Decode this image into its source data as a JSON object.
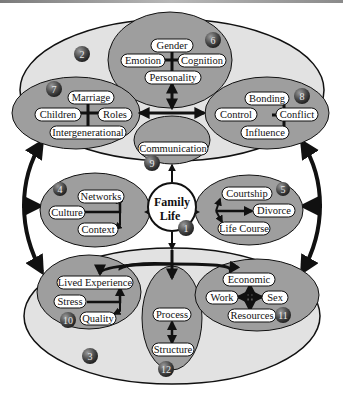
{
  "diagram": {
    "center": {
      "line1": "Family",
      "line2": "Life",
      "number": "1"
    },
    "outer_top": {
      "number": "2"
    },
    "outer_bottom": {
      "number": "3"
    },
    "themes": {
      "t4": {
        "number": "4",
        "items": [
          "Networks",
          "Culture",
          "Context"
        ]
      },
      "t5": {
        "number": "5",
        "items": [
          "Courtship",
          "Divorce",
          "Life Course"
        ]
      },
      "t6": {
        "number": "6",
        "items": [
          "Gender",
          "Emotion",
          "Cognition",
          "Personality"
        ]
      },
      "t7": {
        "number": "7",
        "items": [
          "Marriage",
          "Children",
          "Roles",
          "Intergenerational"
        ]
      },
      "t8": {
        "number": "8",
        "items": [
          "Bonding",
          "Control",
          "Conflict",
          "Influence"
        ]
      },
      "t9": {
        "number": "9",
        "items": [
          "Communication"
        ]
      },
      "t10": {
        "number": "10",
        "items": [
          "Lived Experience",
          "Stress",
          "Quality"
        ]
      },
      "t11": {
        "number": "11",
        "items": [
          "Economic",
          "Work",
          "Sex",
          "Resources"
        ]
      },
      "t12": {
        "number": "12",
        "items": [
          "Process",
          "Structure"
        ]
      }
    },
    "colors": {
      "outer_fill": "#e2e2e2",
      "inner_fill": "#9e9e9e",
      "pill_fill": "#ffffff",
      "stroke": "#111111",
      "badge": "#4a4a4a"
    }
  }
}
